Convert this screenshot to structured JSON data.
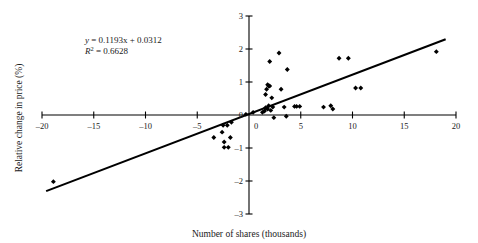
{
  "chart_data": {
    "type": "scatter",
    "title": "",
    "xlabel": "Number of shares (thousands)",
    "ylabel": "Relative change in price (%)",
    "xlim": [
      -20,
      20
    ],
    "ylim": [
      -3,
      3
    ],
    "xticks": [
      -20,
      -15,
      -10,
      -5,
      0,
      5,
      10,
      15,
      20
    ],
    "yticks": [
      -3,
      -2,
      -1,
      0,
      1,
      2,
      3
    ],
    "xtick_labels": [
      "-20",
      "-15",
      "-10",
      "-5",
      "0",
      "5",
      "10",
      "15",
      "20"
    ],
    "ytick_labels": [
      "-3",
      "-2",
      "-1",
      "0",
      "1",
      "2",
      "3"
    ],
    "grid": false,
    "legend": false,
    "marker": "diamond",
    "marker_color": "#000000",
    "line_color": "#000000",
    "points": [
      {
        "x": -18.9,
        "y": -2.02
      },
      {
        "x": -3.4,
        "y": -0.68
      },
      {
        "x": -2.6,
        "y": -0.52
      },
      {
        "x": -2.5,
        "y": -0.31
      },
      {
        "x": -2.4,
        "y": -0.82
      },
      {
        "x": -2.4,
        "y": -0.98
      },
      {
        "x": -2.1,
        "y": -0.31
      },
      {
        "x": -2.0,
        "y": -0.98
      },
      {
        "x": -1.8,
        "y": -0.68
      },
      {
        "x": -1.7,
        "y": -0.22
      },
      {
        "x": -0.3,
        "y": 0.02
      },
      {
        "x": 0.4,
        "y": 0.08
      },
      {
        "x": 1.3,
        "y": 0.08
      },
      {
        "x": 1.5,
        "y": 0.12
      },
      {
        "x": 1.6,
        "y": 0.22
      },
      {
        "x": 1.6,
        "y": 0.62
      },
      {
        "x": 1.7,
        "y": 0.78
      },
      {
        "x": 1.8,
        "y": 0.18
      },
      {
        "x": 1.8,
        "y": 0.92
      },
      {
        "x": 1.9,
        "y": 0.28
      },
      {
        "x": 1.9,
        "y": 0.88
      },
      {
        "x": 2.0,
        "y": 0.88
      },
      {
        "x": 2.0,
        "y": 1.62
      },
      {
        "x": 2.1,
        "y": 0.14
      },
      {
        "x": 2.2,
        "y": 0.52
      },
      {
        "x": 2.3,
        "y": 0.24
      },
      {
        "x": 2.4,
        "y": -0.08
      },
      {
        "x": 2.9,
        "y": 1.88
      },
      {
        "x": 3.1,
        "y": 0.78
      },
      {
        "x": 3.4,
        "y": 0.24
      },
      {
        "x": 3.6,
        "y": -0.04
      },
      {
        "x": 3.7,
        "y": 1.38
      },
      {
        "x": 4.4,
        "y": 0.26
      },
      {
        "x": 4.6,
        "y": 0.26
      },
      {
        "x": 4.9,
        "y": 0.26
      },
      {
        "x": 7.2,
        "y": 0.24
      },
      {
        "x": 7.9,
        "y": 0.28
      },
      {
        "x": 8.1,
        "y": 0.18
      },
      {
        "x": 8.7,
        "y": 1.72
      },
      {
        "x": 9.6,
        "y": 1.72
      },
      {
        "x": 10.3,
        "y": 0.82
      },
      {
        "x": 10.8,
        "y": 0.82
      },
      {
        "x": 18.1,
        "y": 1.92
      }
    ],
    "trendline": {
      "slope": 0.1193,
      "intercept": 0.0312,
      "x_start": -19.6,
      "x_end": 19.0
    },
    "annotations": {
      "equation_y": "y",
      "equation_body": " = 0.1193x + 0.0312",
      "r_squared_symbol": "R",
      "r_squared_exponent": "2",
      "r_squared_body": " = 0.6628"
    }
  }
}
